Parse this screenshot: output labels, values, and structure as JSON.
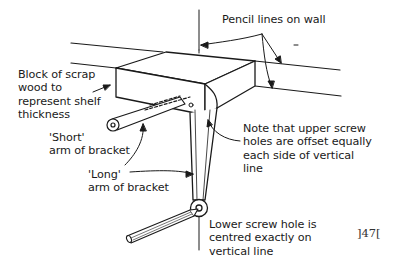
{
  "diagram": {
    "colors": {
      "ink": "#1a1a1a",
      "background": "#ffffff"
    }
  },
  "labels": {
    "pencil_lines": "Pencil lines on wall",
    "block": "Block of scrap\nwood to\nrepresent shelf\nthickness",
    "short_arm": "'Short'\narm of bracket",
    "long_arm": "'Long'\narm of bracket",
    "upper_holes_note": "Note that upper screw\nholes are offset equally\neach side of vertical\nline",
    "lower_hole_note": "Lower screw hole is\ncentred exactly on\nvertical line",
    "page_number": "]47["
  },
  "parts": [
    {
      "name": "wall-pencil-line-upper",
      "kind": "line"
    },
    {
      "name": "wall-pencil-line-lower",
      "kind": "line"
    },
    {
      "name": "vertical-pencil-line",
      "kind": "line"
    },
    {
      "name": "scrap-wood-block",
      "kind": "box"
    },
    {
      "name": "short-arm-bracket",
      "kind": "bracket-arm"
    },
    {
      "name": "long-arm-bracket",
      "kind": "bracket-arm"
    },
    {
      "name": "pencil",
      "kind": "tool"
    }
  ]
}
